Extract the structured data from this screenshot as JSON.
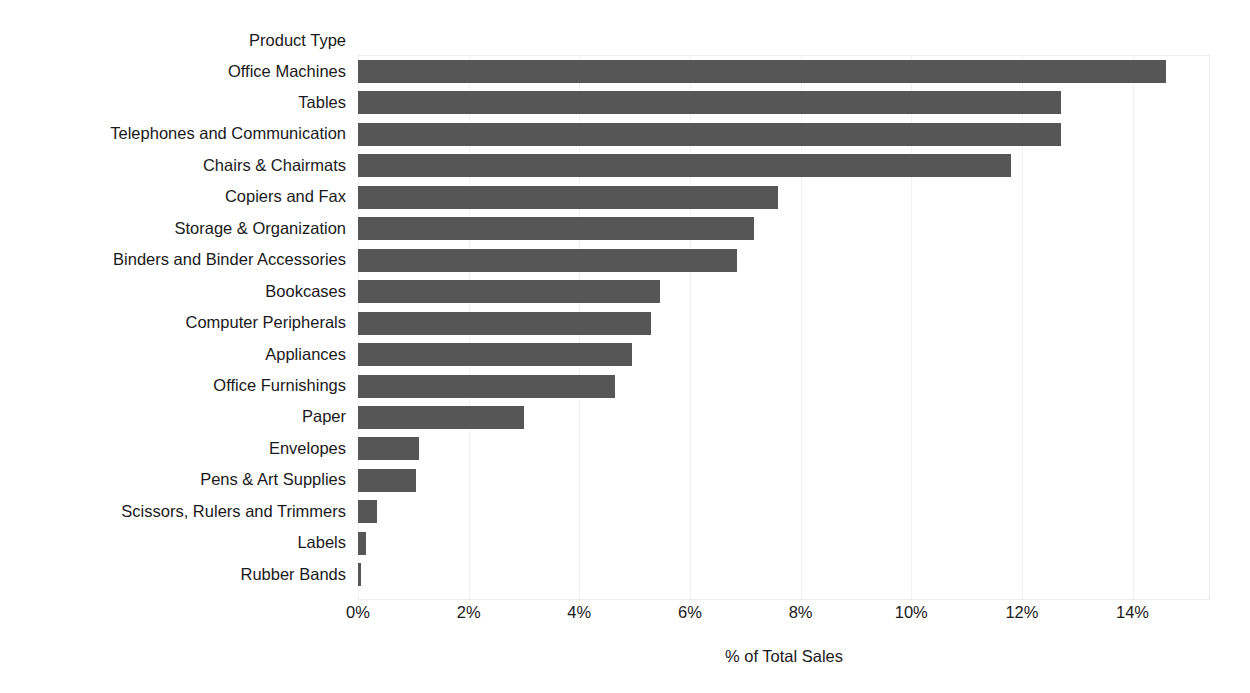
{
  "chart_data": {
    "type": "bar",
    "orientation": "horizontal",
    "title": "",
    "header_label": "Product Type",
    "xlabel": "% of Total Sales",
    "ylabel": "Product Type",
    "xlim": [
      0,
      15.4
    ],
    "xticks": [
      0,
      2,
      4,
      6,
      8,
      10,
      12,
      14
    ],
    "xtick_labels": [
      "0%",
      "2%",
      "4%",
      "6%",
      "8%",
      "10%",
      "12%",
      "14%"
    ],
    "grid": true,
    "grid_axis": "x",
    "legend": false,
    "bar_color": "#565656",
    "categories": [
      "Office Machines",
      "Tables",
      "Telephones and Communication",
      "Chairs & Chairmats",
      "Copiers and Fax",
      "Storage & Organization",
      "Binders and Binder Accessories",
      "Bookcases",
      "Computer Peripherals",
      "Appliances",
      "Office Furnishings",
      "Paper",
      "Envelopes",
      "Pens & Art Supplies",
      "Scissors, Rulers and Trimmers",
      "Labels",
      "Rubber Bands"
    ],
    "values": [
      14.6,
      12.7,
      12.7,
      11.8,
      7.6,
      7.15,
      6.85,
      5.45,
      5.3,
      4.95,
      4.65,
      3.0,
      1.1,
      1.05,
      0.35,
      0.15,
      0.05
    ],
    "value_labels": [
      "14.6%",
      "12.7%",
      "12.7%",
      "11.8%",
      "7.6%",
      "7.15%",
      "6.85%",
      "5.45%",
      "5.3%",
      "4.95%",
      "4.65%",
      "3.0%",
      "1.1%",
      "1.05%",
      "0.35%",
      "0.15%",
      "0.05%"
    ]
  }
}
